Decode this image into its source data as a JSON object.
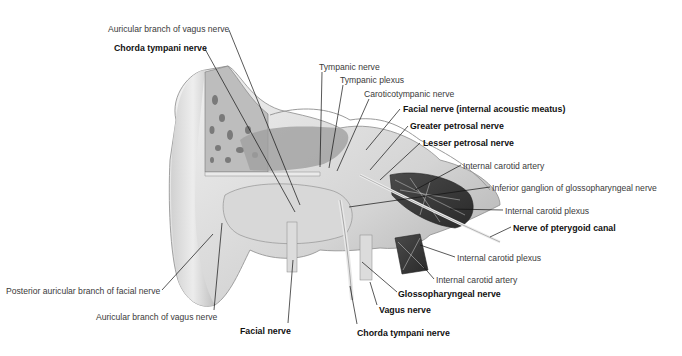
{
  "figure": {
    "labels": [
      {
        "id": "auricular-branch-vagus-top",
        "text": "Auricular branch of vagus nerve",
        "x": 108,
        "y": 24,
        "bold": false
      },
      {
        "id": "chorda-tympani-top",
        "text": "Chorda tympani nerve",
        "x": 114,
        "y": 43,
        "bold": true
      },
      {
        "id": "tympanic-nerve",
        "text": "Tympanic nerve",
        "x": 319,
        "y": 62,
        "bold": false
      },
      {
        "id": "tympanic-plexus",
        "text": "Tympanic plexus",
        "x": 340,
        "y": 75,
        "bold": false
      },
      {
        "id": "caroticotympanic-nerve",
        "text": "Caroticotympanic nerve",
        "x": 364,
        "y": 89,
        "bold": false
      },
      {
        "id": "facial-nerve-iam",
        "text": "Facial nerve (internal acoustic meatus)",
        "x": 403,
        "y": 104,
        "bold": true
      },
      {
        "id": "greater-petrosal",
        "text": "Greater petrosal nerve",
        "x": 410,
        "y": 121,
        "bold": true
      },
      {
        "id": "lesser-petrosal",
        "text": "Lesser petrosal nerve",
        "x": 423,
        "y": 138,
        "bold": true
      },
      {
        "id": "internal-carotid-artery-top",
        "text": "Internal carotid artery",
        "x": 463,
        "y": 161,
        "bold": false
      },
      {
        "id": "inferior-ganglion",
        "text": "Inferior ganglion of glossopharyngeal nerve",
        "x": 492,
        "y": 183,
        "bold": false
      },
      {
        "id": "internal-carotid-plexus-top",
        "text": "Internal carotid plexus",
        "x": 505,
        "y": 206,
        "bold": false
      },
      {
        "id": "nerve-pterygoid-canal",
        "text": "Nerve of pterygoid canal",
        "x": 513,
        "y": 223,
        "bold": true
      },
      {
        "id": "internal-carotid-plexus-bottom",
        "text": "Internal carotid plexus",
        "x": 457,
        "y": 253,
        "bold": false
      },
      {
        "id": "internal-carotid-artery-bottom",
        "text": "Internal carotid artery",
        "x": 436,
        "y": 275,
        "bold": false
      },
      {
        "id": "glossopharyngeal-nerve",
        "text": "Glossopharyngeal nerve",
        "x": 398,
        "y": 289,
        "bold": true
      },
      {
        "id": "vagus-nerve",
        "text": "Vagus nerve",
        "x": 379,
        "y": 305,
        "bold": true
      },
      {
        "id": "chorda-tympani-bottom",
        "text": "Chorda tympani nerve",
        "x": 357,
        "y": 328,
        "bold": true
      },
      {
        "id": "posterior-auricular-branch",
        "text": "Posterior auricular branch of facial nerve",
        "x": 6,
        "y": 286,
        "bold": false
      },
      {
        "id": "auricular-branch-vagus-bottom",
        "text": "Auricular branch of vagus nerve",
        "x": 96,
        "y": 312,
        "bold": false
      },
      {
        "id": "facial-nerve",
        "text": "Facial nerve",
        "x": 240,
        "y": 326,
        "bold": true
      }
    ]
  },
  "colors": {
    "background": "#ffffff",
    "bone_light": "#e6e6e6",
    "bone_mid": "#c8c8c8",
    "bone_dark": "#8a8a8a",
    "vessel_dark": "#3c3c3c",
    "leader_line": "#111111"
  }
}
